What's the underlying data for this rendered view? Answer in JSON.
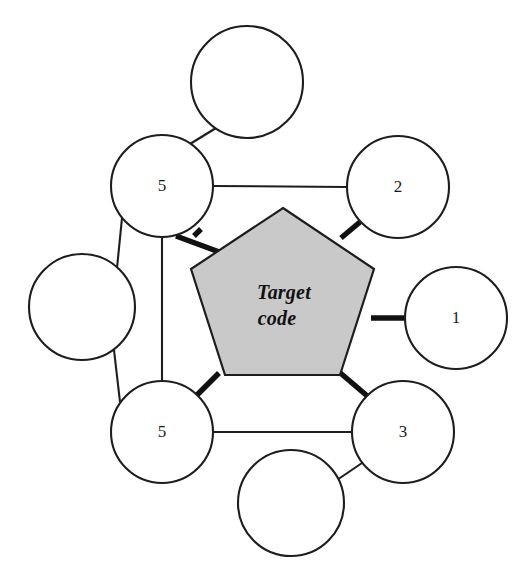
{
  "diagram": {
    "background_color": "#ffffff",
    "center": {
      "shape": "pentagon",
      "label_line1": "Target",
      "label_line2": "code",
      "fill_color": "#c9c9c9",
      "stroke_color": "#1d1d1d",
      "cx": 282,
      "cy": 300,
      "radius": 92,
      "rotation_deg": 0
    },
    "nodes": [
      {
        "id": "n-top-left",
        "label": "5",
        "cx": 162,
        "cy": 186,
        "r": 51,
        "filled": false
      },
      {
        "id": "n-upper-right",
        "label": "2",
        "cx": 398,
        "cy": 187,
        "r": 51,
        "filled": false
      },
      {
        "id": "n-right",
        "label": "1",
        "cx": 456,
        "cy": 318,
        "r": 51,
        "filled": false
      },
      {
        "id": "n-lower-right",
        "label": "3",
        "cx": 403,
        "cy": 432,
        "r": 51,
        "filled": false
      },
      {
        "id": "n-bottom-left",
        "label": "5",
        "cx": 162,
        "cy": 432,
        "r": 51,
        "filled": false
      },
      {
        "id": "n-top-empty",
        "label": "",
        "cx": 247,
        "cy": 82,
        "r": 56,
        "filled": false
      },
      {
        "id": "n-left-empty",
        "label": "",
        "cx": 82,
        "cy": 307,
        "r": 53,
        "filled": false
      },
      {
        "id": "n-bottom-empty",
        "label": "",
        "cx": 291,
        "cy": 503,
        "r": 53,
        "filled": false
      }
    ],
    "spokes": [
      {
        "from": "center",
        "to": "n-top-left",
        "weight": "thick"
      },
      {
        "from": "center",
        "to": "n-upper-right",
        "weight": "thick"
      },
      {
        "from": "center",
        "to": "n-right",
        "weight": "thick"
      },
      {
        "from": "center",
        "to": "n-lower-right",
        "weight": "thick"
      },
      {
        "from": "center",
        "to": "n-bottom-left",
        "weight": "thick"
      }
    ],
    "ring_edges": [
      {
        "from": "n-top-left",
        "to": "n-upper-right",
        "weight": "thin"
      },
      {
        "from": "n-bottom-left",
        "to": "n-lower-right",
        "weight": "thin"
      },
      {
        "from": "n-top-left",
        "to": "n-bottom-left",
        "weight": "thin"
      },
      {
        "from": "n-top-left",
        "to": "n-top-empty",
        "weight": "thin"
      },
      {
        "from": "n-top-left",
        "to": "n-left-empty",
        "weight": "thin"
      },
      {
        "from": "n-bottom-left",
        "to": "n-left-empty",
        "weight": "thin"
      },
      {
        "from": "n-lower-right",
        "to": "n-bottom-empty",
        "weight": "thin"
      }
    ]
  }
}
